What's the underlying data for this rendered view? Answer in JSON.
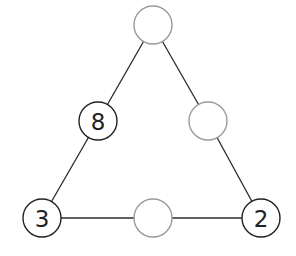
{
  "diagram": {
    "type": "number-triangle-puzzle",
    "colors": {
      "line": "#2a2a2a",
      "filled_node_stroke": "#222222",
      "empty_node_stroke": "#9a9a9a",
      "background": "#ffffff"
    },
    "nodes": [
      {
        "id": "top",
        "x": 153,
        "y": 25,
        "value": ""
      },
      {
        "id": "left-mid",
        "x": 98,
        "y": 121,
        "value": "8"
      },
      {
        "id": "right-mid",
        "x": 208,
        "y": 121,
        "value": ""
      },
      {
        "id": "bottom-left",
        "x": 42,
        "y": 218,
        "value": "3"
      },
      {
        "id": "bottom-mid",
        "x": 153,
        "y": 218,
        "value": ""
      },
      {
        "id": "bottom-right",
        "x": 261,
        "y": 218,
        "value": "2"
      }
    ],
    "edges": [
      [
        "top",
        "left-mid"
      ],
      [
        "left-mid",
        "bottom-left"
      ],
      [
        "top",
        "right-mid"
      ],
      [
        "right-mid",
        "bottom-right"
      ],
      [
        "bottom-left",
        "bottom-mid"
      ],
      [
        "bottom-mid",
        "bottom-right"
      ]
    ]
  }
}
